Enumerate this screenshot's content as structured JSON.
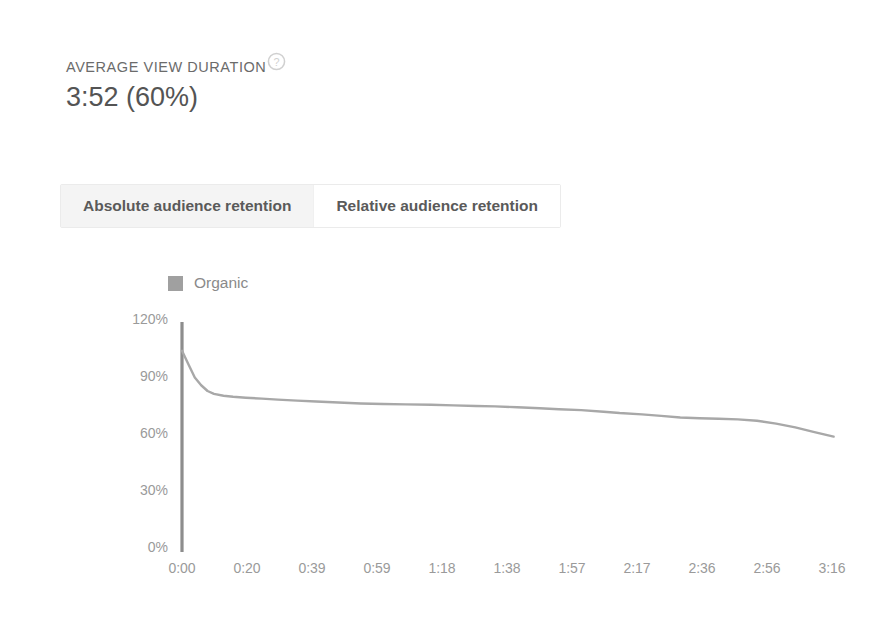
{
  "metric": {
    "label": "AVERAGE VIEW DURATION",
    "value": "3:52 (60%)",
    "help_icon": "help-circle-icon"
  },
  "tabs": [
    {
      "label": "Absolute audience retention",
      "active": true
    },
    {
      "label": "Relative audience retention",
      "active": false
    }
  ],
  "colors": {
    "line": "#a8a8a8",
    "axis": "#8d8d8d",
    "legend_swatch": "#a0a0a0",
    "tick_text": "#9a9a9a",
    "tab_active_bg": "#f4f4f4"
  },
  "chart_data": {
    "type": "line",
    "title": "",
    "xlabel": "",
    "ylabel": "",
    "grid": false,
    "legend_position": "top-left",
    "legend": [
      "Organic"
    ],
    "ylim": [
      0,
      120
    ],
    "ytick_labels": [
      "120%",
      "90%",
      "60%",
      "30%",
      "0%"
    ],
    "ytick_values": [
      120,
      90,
      60,
      30,
      0
    ],
    "xtick_labels": [
      "0:00",
      "0:20",
      "0:39",
      "0:59",
      "1:18",
      "1:38",
      "1:57",
      "2:17",
      "2:36",
      "2:56",
      "3:16"
    ],
    "xtick_seconds": [
      0,
      20,
      39,
      59,
      78,
      98,
      117,
      137,
      156,
      176,
      196
    ],
    "xlim_seconds": [
      0,
      206
    ],
    "series": [
      {
        "name": "Organic",
        "x": [
          0,
          2,
          4,
          6,
          8,
          10,
          13,
          16,
          20,
          25,
          30,
          36,
          42,
          49,
          56,
          63,
          70,
          78,
          85,
          92,
          98,
          105,
          112,
          118,
          125,
          132,
          137,
          144,
          150,
          156,
          162,
          168,
          174,
          180,
          186,
          192,
          198,
          204
        ],
        "values": [
          105,
          98,
          91,
          87,
          84,
          82.5,
          81.5,
          81,
          80.5,
          80,
          79.5,
          79,
          78.5,
          78,
          77.5,
          77.2,
          77,
          76.8,
          76.5,
          76.2,
          76,
          75.5,
          75,
          74.5,
          74,
          73.2,
          72.5,
          71.8,
          71,
          70.2,
          69.8,
          69.5,
          69.2,
          68.5,
          67,
          65,
          62.5,
          60.2
        ]
      }
    ]
  }
}
